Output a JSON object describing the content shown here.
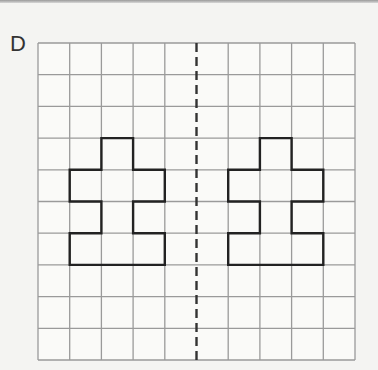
{
  "label": "D",
  "grid": {
    "cols": 10,
    "rows": 10,
    "left": 38,
    "top": 43,
    "cell": 31.7,
    "line_color": "#9a9a9a"
  },
  "mirror_line": {
    "col": 5,
    "style": "dashed",
    "color": "#333333"
  },
  "shape_color": "#222222",
  "shapes": [
    {
      "name": "left-shape",
      "points": [
        [
          2,
          3
        ],
        [
          3,
          3
        ],
        [
          3,
          4
        ],
        [
          4,
          4
        ],
        [
          4,
          5
        ],
        [
          3,
          5
        ],
        [
          3,
          6
        ],
        [
          4,
          6
        ],
        [
          4,
          7
        ],
        [
          1,
          7
        ],
        [
          1,
          6
        ],
        [
          2,
          6
        ],
        [
          2,
          5
        ],
        [
          1,
          5
        ],
        [
          1,
          4
        ],
        [
          2,
          4
        ]
      ]
    },
    {
      "name": "right-shape",
      "points": [
        [
          7,
          3
        ],
        [
          8,
          3
        ],
        [
          8,
          4
        ],
        [
          9,
          4
        ],
        [
          9,
          5
        ],
        [
          8,
          5
        ],
        [
          8,
          6
        ],
        [
          9,
          6
        ],
        [
          9,
          7
        ],
        [
          6,
          7
        ],
        [
          6,
          6
        ],
        [
          7,
          6
        ],
        [
          7,
          5
        ],
        [
          6,
          5
        ],
        [
          6,
          4
        ],
        [
          7,
          4
        ]
      ]
    }
  ]
}
